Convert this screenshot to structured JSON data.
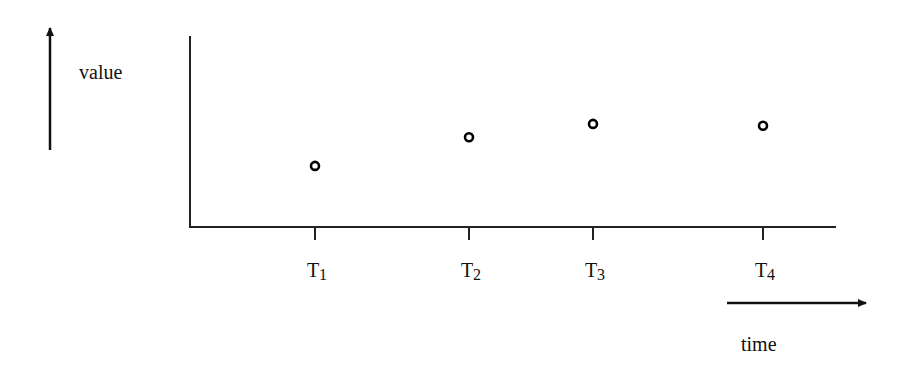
{
  "chart_data": {
    "type": "scatter",
    "title": "",
    "xlabel": "time",
    "ylabel": "value",
    "categories": [
      "T1",
      "T2",
      "T3",
      "T4"
    ],
    "tick_labels": [
      {
        "base": "T",
        "sub": "1"
      },
      {
        "base": "T",
        "sub": "2"
      },
      {
        "base": "T",
        "sub": "3"
      },
      {
        "base": "T",
        "sub": "4"
      }
    ],
    "x": [
      1,
      2,
      3,
      4
    ],
    "values": [
      0.32,
      0.47,
      0.54,
      0.53
    ],
    "marker": "open-circle",
    "grid": false,
    "legend": null,
    "ylim": [
      0,
      1
    ]
  },
  "labels": {
    "y_axis": "value",
    "x_axis": "time"
  }
}
